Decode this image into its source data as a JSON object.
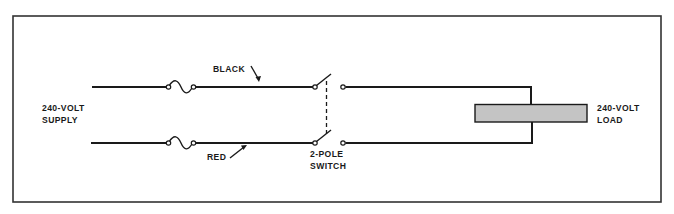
{
  "diagram": {
    "labels": {
      "supply_line1": "240-VOLT",
      "supply_line2": "SUPPLY",
      "black_wire": "BLACK",
      "red_wire": "RED",
      "switch_line1": "2-POLE",
      "switch_line2": "SWITCH",
      "load_line1": "240-VOLT",
      "load_line2": "LOAD"
    },
    "components": [
      {
        "type": "fuse",
        "wire": "black"
      },
      {
        "type": "fuse",
        "wire": "red"
      },
      {
        "type": "switch",
        "poles": 2
      },
      {
        "type": "load",
        "rating": "240-VOLT"
      }
    ],
    "colors": {
      "line": "#1a1a1a",
      "frame": "#333333",
      "load_fill": "#c4c4c4",
      "background": "#ffffff"
    }
  }
}
